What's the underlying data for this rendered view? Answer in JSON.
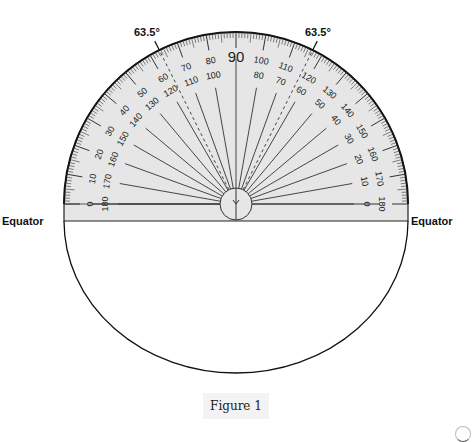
{
  "figure": {
    "caption": "Figure 1",
    "labels": {
      "equator_left": "Equator",
      "equator_right": "Equator",
      "angle_left": "63.5°",
      "angle_right": "63.5°",
      "top_center": "90"
    },
    "protractor": {
      "outer_scale": [
        "0",
        "10",
        "20",
        "30",
        "40",
        "50",
        "60",
        "70",
        "80",
        "90",
        "100",
        "110",
        "120",
        "130",
        "140",
        "150",
        "160",
        "170",
        "180"
      ],
      "inner_scale": [
        "180",
        "170",
        "160",
        "150",
        "140",
        "130",
        "120",
        "110",
        "100",
        "90",
        "80",
        "70",
        "60",
        "50",
        "40",
        "30",
        "20",
        "10",
        "0"
      ],
      "marked_angle_deg": 63.5,
      "fill_color": "#e6e6e6",
      "line_color": "#222222"
    }
  }
}
